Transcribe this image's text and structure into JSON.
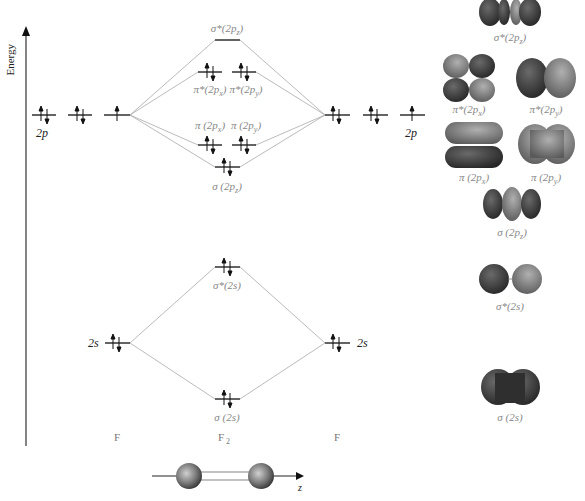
{
  "diagram": {
    "axis": {
      "label": "Energy",
      "direction": "up"
    },
    "atoms": {
      "left": "F",
      "center": "F",
      "center_sub": "2",
      "right": "F"
    },
    "atomic_orbitals": {
      "left_2p": {
        "label": "2p",
        "electrons": [
          "↑↓",
          "↑↓",
          "↑"
        ]
      },
      "right_2p": {
        "label": "2p",
        "electrons": [
          "↑↓",
          "↑↓",
          "↑"
        ]
      },
      "left_2s": {
        "label": "2s",
        "electrons": "↑↓"
      },
      "right_2s": {
        "label": "2s",
        "electrons": "↑↓"
      }
    },
    "molecular_orbitals": [
      {
        "id": "sigma_star_2pz",
        "label": "σ*(2p",
        "sub": "z",
        "close": ")",
        "electrons": "empty"
      },
      {
        "id": "pi_star_2px",
        "label": "π*(2p",
        "sub": "x",
        "close": ")",
        "electrons": "↑↓"
      },
      {
        "id": "pi_star_2py",
        "label": "π*(2p",
        "sub": "y",
        "close": ")",
        "electrons": "↑↓"
      },
      {
        "id": "pi_2px",
        "label": "π (2p",
        "sub": "x",
        "close": ")",
        "electrons": "↑↓"
      },
      {
        "id": "pi_2py",
        "label": "π (2p",
        "sub": "y",
        "close": ")",
        "electrons": "↑↓"
      },
      {
        "id": "sigma_2pz",
        "label": "σ (2p",
        "sub": "z",
        "close": ")",
        "electrons": "↑↓"
      },
      {
        "id": "sigma_star_2s",
        "label": "σ*(2s)",
        "electrons": "↑↓"
      },
      {
        "id": "sigma_2s",
        "label": "σ (2s)",
        "electrons": "↑↓"
      }
    ],
    "molecule_axis": {
      "label": "z"
    },
    "orbital_shapes": [
      {
        "id": "shape_sigma_star_2pz",
        "label": "σ*(2p",
        "sub": "z",
        "close": ")"
      },
      {
        "id": "shape_pi_star_2px",
        "label": "π*(2p",
        "sub": "x",
        "close": ")"
      },
      {
        "id": "shape_pi_star_2py",
        "label": "π*(2p",
        "sub": "y",
        "close": ")"
      },
      {
        "id": "shape_pi_2px",
        "label": "π (2p",
        "sub": "x",
        "close": ")"
      },
      {
        "id": "shape_pi_2py",
        "label": "π (2p",
        "sub": "y",
        "close": ")"
      },
      {
        "id": "shape_sigma_2pz",
        "label": "σ (2p",
        "sub": "z",
        "close": ")"
      },
      {
        "id": "shape_sigma_star_2s",
        "label": "σ*(2s)"
      },
      {
        "id": "shape_sigma_2s",
        "label": "σ (2s)"
      }
    ],
    "colors": {
      "level": "#222222",
      "connector": "#aaaaaa",
      "label": "#888888",
      "lobe_dark": "#3a3a3a",
      "lobe_light": "#8a8a8a"
    }
  }
}
